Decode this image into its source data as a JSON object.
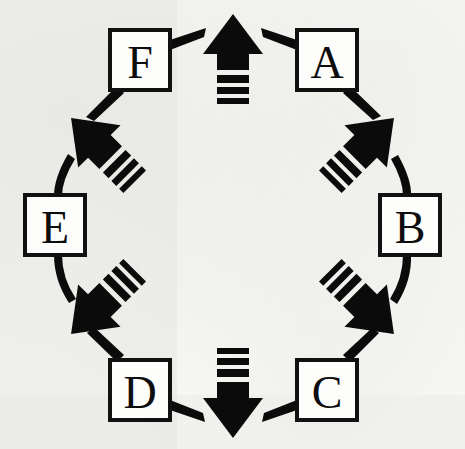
{
  "figure": {
    "type": "cycle-diagram",
    "background_color": "#fbfbf9",
    "ink_color": "#0b0b0b",
    "box_fill_color": "#fdfdfb",
    "node_count": 6,
    "arrow_count": 8,
    "direction": "clockwise"
  },
  "nodes": [
    {
      "id": "A",
      "label": "A",
      "position": "top-right",
      "cx": 327,
      "cy": 60,
      "w": 60,
      "h": 60
    },
    {
      "id": "B",
      "label": "B",
      "position": "right",
      "cx": 410,
      "cy": 225,
      "w": 60,
      "h": 60
    },
    {
      "id": "C",
      "label": "C",
      "position": "bottom-right",
      "cx": 327,
      "cy": 390,
      "w": 60,
      "h": 60
    },
    {
      "id": "D",
      "label": "D",
      "position": "bottom-left",
      "cx": 140,
      "cy": 390,
      "w": 60,
      "h": 60
    },
    {
      "id": "E",
      "label": "E",
      "position": "left",
      "cx": 55,
      "cy": 225,
      "w": 60,
      "h": 60
    },
    {
      "id": "F",
      "label": "F",
      "position": "top-left",
      "cx": 140,
      "cy": 60,
      "w": 60,
      "h": 60
    }
  ],
  "arrows": [
    {
      "id": "arrow-top",
      "points": "up",
      "angle_deg": 0,
      "cx": 233,
      "cy": 62,
      "tail_stripes": 3
    },
    {
      "id": "arrow-upper-right",
      "points": "up-right",
      "angle_deg": 45,
      "cx": 360,
      "cy": 152,
      "tail_stripes": 3
    },
    {
      "id": "arrow-lower-right",
      "points": "down-right",
      "angle_deg": 135,
      "cx": 360,
      "cy": 300,
      "tail_stripes": 3
    },
    {
      "id": "arrow-bottom",
      "points": "down",
      "angle_deg": 180,
      "cx": 233,
      "cy": 390,
      "tail_stripes": 3
    },
    {
      "id": "arrow-lower-left",
      "points": "down-left",
      "angle_deg": 225,
      "cx": 105,
      "cy": 300,
      "tail_stripes": 3
    },
    {
      "id": "arrow-upper-left",
      "points": "up-left",
      "angle_deg": 315,
      "cx": 105,
      "cy": 152,
      "tail_stripes": 3
    }
  ],
  "connectors": [
    {
      "id": "connector-f-to-top",
      "from": "F",
      "to": "arrow-top"
    },
    {
      "id": "connector-a-to-top",
      "from": "A",
      "to": "arrow-top"
    },
    {
      "id": "connector-a-to-ur",
      "from": "A",
      "to": "arrow-upper-right"
    },
    {
      "id": "connector-ur-to-b",
      "from": "arrow-upper-right",
      "to": "B"
    },
    {
      "id": "connector-b-to-lr",
      "from": "B",
      "to": "arrow-lower-right"
    },
    {
      "id": "connector-lr-to-c",
      "from": "arrow-lower-right",
      "to": "C"
    },
    {
      "id": "connector-c-to-bottom",
      "from": "C",
      "to": "arrow-bottom"
    },
    {
      "id": "connector-d-to-bottom",
      "from": "D",
      "to": "arrow-bottom"
    },
    {
      "id": "connector-d-to-ll",
      "from": "D",
      "to": "arrow-lower-left"
    },
    {
      "id": "connector-ll-to-e",
      "from": "arrow-lower-left",
      "to": "E"
    },
    {
      "id": "connector-e-to-ul",
      "from": "E",
      "to": "arrow-upper-left"
    },
    {
      "id": "connector-ul-to-f",
      "from": "arrow-upper-left",
      "to": "F"
    }
  ]
}
